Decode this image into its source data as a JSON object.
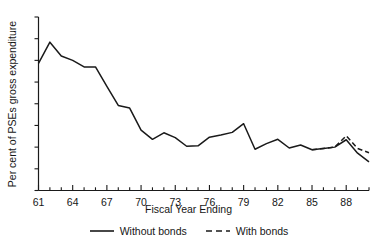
{
  "chart_data": {
    "type": "line",
    "title": "",
    "xlabel": "Fiscal Year Ending",
    "ylabel": "Per cent of PSEs gross expenditure",
    "xlim": [
      61,
      90
    ],
    "ylim": [
      0,
      40
    ],
    "grid": false,
    "legend_position": "bottom",
    "x_tick_labels": [
      "61",
      "64",
      "67",
      "70",
      "73",
      "76",
      "79",
      "82",
      "85",
      "88"
    ],
    "x_tick_values": [
      61,
      64,
      67,
      70,
      73,
      76,
      79,
      82,
      85,
      88
    ],
    "x_minor_ticks": [
      62,
      63,
      65,
      66,
      68,
      69,
      71,
      72,
      74,
      75,
      77,
      78,
      80,
      81,
      83,
      84,
      86,
      87,
      89,
      90
    ],
    "y_tick_labels": [
      "0",
      "5",
      "10",
      "15",
      "20",
      "25",
      "30",
      "35",
      "40"
    ],
    "y_tick_values": [
      0,
      5,
      10,
      15,
      20,
      25,
      30,
      35,
      40
    ],
    "x": [
      61,
      62,
      63,
      64,
      65,
      66,
      67,
      68,
      69,
      70,
      71,
      72,
      73,
      74,
      75,
      76,
      77,
      78,
      79,
      80,
      81,
      82,
      83,
      84,
      85,
      86,
      87,
      88,
      89,
      90
    ],
    "series": [
      {
        "name": "Without bonds",
        "style": "solid",
        "color": "#1a1a1a",
        "x": [
          61,
          62,
          63,
          64,
          65,
          66,
          67,
          68,
          69,
          70,
          71,
          72,
          73,
          74,
          75,
          76,
          77,
          78,
          79,
          80,
          81,
          82,
          83,
          84,
          85,
          86,
          87,
          88,
          89,
          90
        ],
        "values": [
          29.3,
          34.2,
          31.0,
          30.0,
          28.5,
          28.5,
          24.0,
          19.6,
          19.0,
          13.9,
          11.8,
          13.3,
          12.2,
          10.2,
          10.3,
          12.3,
          12.8,
          13.4,
          15.4,
          9.5,
          10.8,
          11.8,
          9.8,
          10.5,
          9.4,
          9.7,
          10.0,
          11.7,
          8.6,
          6.6
        ]
      },
      {
        "name": "With bonds",
        "style": "dashed",
        "color": "#1a1a1a",
        "x": [
          85,
          86,
          87,
          88,
          89,
          90
        ],
        "values": [
          9.4,
          9.7,
          10.0,
          12.6,
          9.7,
          8.7
        ]
      }
    ],
    "legend": [
      {
        "label": "Without bonds",
        "style": "solid"
      },
      {
        "label": "With bonds",
        "style": "dashed"
      }
    ]
  },
  "axis": {
    "y_title": "Per cent of PSEs gross expenditure",
    "x_title": "Fiscal Year Ending"
  }
}
